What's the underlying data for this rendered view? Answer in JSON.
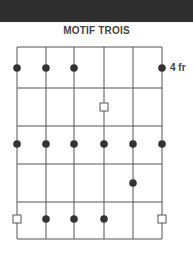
{
  "diagram": {
    "title": "MOTIF TROIS",
    "fret_label": "4 fr",
    "strings": 6,
    "frets": 5,
    "grid": {
      "left": 17,
      "right": 162,
      "top": 47,
      "bottom": 239,
      "string_x": [
        17,
        46,
        74,
        104,
        133,
        162
      ],
      "fret_y": [
        47,
        88,
        126,
        164,
        202,
        239
      ]
    },
    "dots": [
      {
        "string": 1,
        "y": 68
      },
      {
        "string": 2,
        "y": 68
      },
      {
        "string": 3,
        "y": 68
      },
      {
        "string": 6,
        "y": 68
      },
      {
        "string": 1,
        "y": 144
      },
      {
        "string": 2,
        "y": 144
      },
      {
        "string": 3,
        "y": 144
      },
      {
        "string": 4,
        "y": 144
      },
      {
        "string": 5,
        "y": 144
      },
      {
        "string": 6,
        "y": 144
      },
      {
        "string": 5,
        "y": 183
      },
      {
        "string": 2,
        "y": 219
      },
      {
        "string": 3,
        "y": 219
      },
      {
        "string": 4,
        "y": 219
      }
    ],
    "squares": [
      {
        "string": 4,
        "y": 107
      },
      {
        "string": 1,
        "y": 219
      },
      {
        "string": 6,
        "y": 219
      }
    ],
    "colors": {
      "line": "#555555",
      "dot": "#333333",
      "bar": "#2e2e2e"
    }
  }
}
